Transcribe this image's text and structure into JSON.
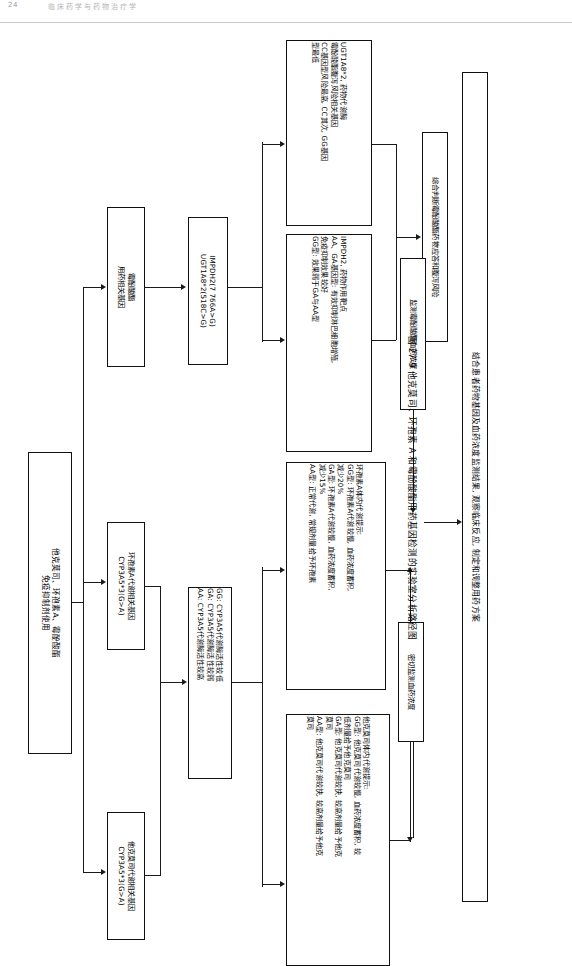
{
  "page_header": {
    "page_number": "24",
    "running_title": "临床药学与药物治疗学"
  },
  "figure": {
    "caption": "图 27-9  他克莫司、环孢素 A 和霉酚酸酯用药基因检测的实验室分析路径图"
  },
  "nodes": {
    "root": "他克莫司、环孢素A、霉酚酸酯\n免疫抑制剂使用",
    "tac_gene": "他克莫司代谢相关基因\nCYP3A5*3(G>A)",
    "csa_gene": "环孢素A代谢相关基因\nCYP3A5*3(G>A)",
    "mpa_gene": "霉酚酸酯\n用药相关基因",
    "mpa_loci": "IMPDH2(7 766A>G)\nUGT1A8*2(518C>G)",
    "cyp3a5_activity": "GG: CYP3A5代谢酶活性较低\nGA: CYP3A5代谢酶活性较弱\nAA: CYP3A5代谢酶活性较高",
    "tac_interpretation": "他克莫司体内代谢提示:\nGG型: 他克莫司代谢较慢, 血药浓度蓄积, 较\n低剂量给予他克莫司\nGA型: 他克莫司代谢较快, 较高剂量给予他克\n莫司\nAA型: 他克莫司代谢较快, 较高剂量给予他克\n莫司",
    "csa_interpretation": "环孢素A体内代谢提示:\nGG型: 环孢素A代谢较慢, 血药浓度蓄积,\n减少20%\nGA型: 环孢素A代谢较慢, 血药浓度蓄积,\n减少15%\nAA型: 正常代谢, 常规剂量给予环孢素",
    "impdh2_interpretation": "IMPDH2, 药物作用靶点\nAA、GA基因型: 有效抑制淋巴细胞增殖,\n免疫抑制效果较好\nGG型: 效果弱于GA与AA型",
    "ugt1a8_interpretation": "UGT1A8*2, 药物代谢酶\n霉酚酸酯腹泻风险相关基因\nCC基因型风险最高, CC其次, GG基因\n型最低",
    "tdm_tac_csa": "密切监测血药浓度",
    "tdm_mpa": "监测霉酚酸酯血药浓度",
    "judge_mpa": "综合判断霉酚酸酯药物应答和腹泻风险",
    "observe": "观察临床反应, 观察和调整用药",
    "final": "结合患者药物基因及血药浓度监测结果, 观察临床反应, 制定和调整用药方案"
  }
}
